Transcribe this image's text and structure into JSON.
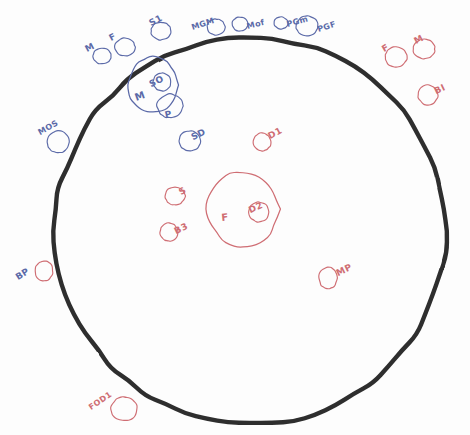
{
  "diagram": {
    "background_color": "#fdfdfd",
    "colors": {
      "boundary": "#2f2f2f",
      "blue_ink": "#5b6aa8",
      "red_ink": "#cf6d73"
    },
    "boundary": {
      "name": "outer-boundary-circle",
      "stroke": "#2f2f2f",
      "stroke_width": 4.4,
      "cx": 250,
      "cy": 231,
      "rx": 196,
      "ry": 193
    }
  },
  "chart_data": {
    "type": "diagram",
    "legend": [
      {
        "color": "#2f2f2f",
        "name": "outer boundary"
      },
      {
        "color": "#5b6aa8",
        "name": "blue nodes"
      },
      {
        "color": "#cf6d73",
        "name": "red nodes"
      }
    ],
    "nodes": [
      {
        "label": "M",
        "color": "blue",
        "cx": 102,
        "cy": 56,
        "rx": 9,
        "ry": 8,
        "lx": 88,
        "ly": 44,
        "rot": -28,
        "inside_boundary": false
      },
      {
        "label": "F",
        "color": "blue",
        "cx": 125,
        "cy": 47,
        "rx": 10,
        "ry": 9,
        "lx": 112,
        "ly": 33,
        "rot": -28,
        "inside_boundary": false
      },
      {
        "label": "S1",
        "color": "blue",
        "cx": 161,
        "cy": 31,
        "rx": 10,
        "ry": 9,
        "lx": 152,
        "ly": 18,
        "rot": -28,
        "inside_boundary": false
      },
      {
        "label": "MGM",
        "color": "blue",
        "cx": 216,
        "cy": 27,
        "rx": 9,
        "ry": 8,
        "lx": 193,
        "ly": 23,
        "rot": -18,
        "inside_boundary": false
      },
      {
        "label": "Mof",
        "color": "blue",
        "cx": 240,
        "cy": 24,
        "rx": 8,
        "ry": 7,
        "lx": 248,
        "ly": 22,
        "rot": -14,
        "inside_boundary": false
      },
      {
        "label": "PGm",
        "color": "blue",
        "cx": 281,
        "cy": 23,
        "rx": 7,
        "ry": 6,
        "lx": 288,
        "ly": 20,
        "rot": -16,
        "inside_boundary": false
      },
      {
        "label": "PGF",
        "color": "blue",
        "cx": 307,
        "cy": 26,
        "rx": 11,
        "ry": 10,
        "lx": 319,
        "ly": 25,
        "rot": -18,
        "inside_boundary": false
      },
      {
        "label": "MOS",
        "color": "blue",
        "cx": 58,
        "cy": 142,
        "rx": 11,
        "ry": 11,
        "lx": 41,
        "ly": 128,
        "rot": -30,
        "inside_boundary": false
      },
      {
        "label": "SD",
        "color": "blue",
        "cx": 190,
        "cy": 141,
        "rx": 11,
        "ry": 10,
        "lx": 194,
        "ly": 132,
        "rot": -26,
        "inside_boundary": true
      },
      {
        "label": "M",
        "color": "blue",
        "cx": 153,
        "cy": 85,
        "rx": 25,
        "ry": 28,
        "lx": 137,
        "ly": 92,
        "rot": -20,
        "inside_boundary": false,
        "role": "compound-large"
      },
      {
        "label": "SO",
        "color": "blue",
        "cx": 162,
        "cy": 82,
        "rx": 9,
        "ry": 9,
        "lx": 152,
        "ly": 79,
        "rot": -26,
        "inside_boundary": false,
        "role": "compound-inner"
      },
      {
        "label": "P",
        "color": "blue",
        "cx": 170,
        "cy": 106,
        "rx": 13,
        "ry": 12,
        "lx": 166,
        "ly": 110,
        "rot": -12,
        "inside_boundary": false,
        "role": "compound-attached"
      },
      {
        "label": "BP",
        "color": "blue",
        "cx": null,
        "cy": null,
        "rx": 0,
        "ry": 0,
        "lx": 19,
        "ly": 272,
        "rot": -32,
        "inside_boundary": false,
        "role": "label-only"
      },
      {
        "label": "F",
        "color": "red",
        "cx": 396,
        "cy": 57,
        "rx": 11,
        "ry": 10,
        "lx": 385,
        "ly": 44,
        "rot": -30,
        "inside_boundary": false
      },
      {
        "label": "M",
        "color": "red",
        "cx": 424,
        "cy": 49,
        "rx": 11,
        "ry": 10,
        "lx": 417,
        "ly": 36,
        "rot": -28,
        "inside_boundary": false
      },
      {
        "label": "BI",
        "color": "red",
        "cx": 428,
        "cy": 95,
        "rx": 10,
        "ry": 10,
        "lx": 437,
        "ly": 86,
        "rot": -26,
        "inside_boundary": false
      },
      {
        "label": "BP",
        "color": "red",
        "cx": 44,
        "cy": 271,
        "rx": 9,
        "ry": 10,
        "lx": null,
        "ly": null,
        "rot": 0,
        "inside_boundary": false,
        "role": "circle-only"
      },
      {
        "label": "D1",
        "color": "red",
        "cx": 262,
        "cy": 142,
        "rx": 9,
        "ry": 9,
        "lx": 271,
        "ly": 131,
        "rot": -28,
        "inside_boundary": true
      },
      {
        "label": "S",
        "color": "red",
        "cx": 175,
        "cy": 196,
        "rx": 10,
        "ry": 9,
        "lx": 182,
        "ly": 187,
        "rot": -30,
        "inside_boundary": true
      },
      {
        "label": "B3",
        "color": "red",
        "cx": 169,
        "cy": 232,
        "rx": 9,
        "ry": 9,
        "lx": 177,
        "ly": 226,
        "rot": -26,
        "inside_boundary": true
      },
      {
        "label": "MP",
        "color": "red",
        "cx": 328,
        "cy": 278,
        "rx": 9,
        "ry": 11,
        "lx": 339,
        "ly": 268,
        "rot": -26,
        "inside_boundary": true
      },
      {
        "label": "FOD1",
        "color": "red",
        "cx": 124,
        "cy": 409,
        "rx": 13,
        "ry": 12,
        "lx": 92,
        "ly": 403,
        "rot": -34,
        "inside_boundary": false
      },
      {
        "label": "F",
        "color": "red",
        "cx": 243,
        "cy": 209,
        "rx": 36,
        "ry": 37,
        "lx": 222,
        "ly": 212,
        "rot": -6,
        "inside_boundary": true,
        "role": "compound-large"
      },
      {
        "label": "D2",
        "color": "red",
        "cx": 259,
        "cy": 212,
        "rx": 10,
        "ry": 10,
        "lx": 251,
        "ly": 205,
        "rot": -24,
        "inside_boundary": true,
        "role": "compound-inner"
      }
    ]
  }
}
